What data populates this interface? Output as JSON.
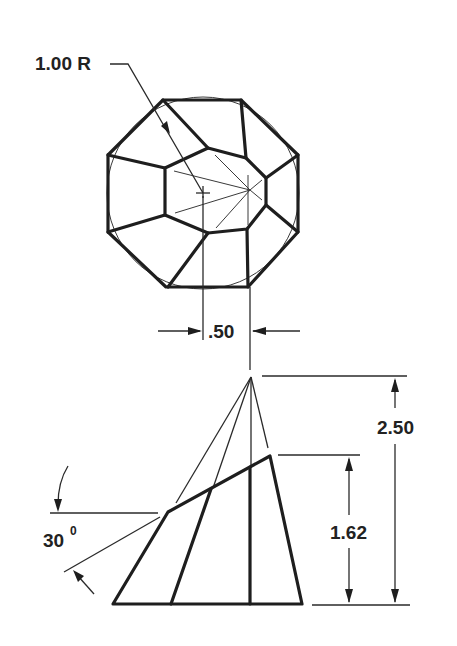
{
  "drawing": {
    "type": "engineering orthographic drawing",
    "subject": "truncated pyramid (frustum) with octagonal base — top view and front view",
    "top_view": {
      "radius_label": "1.00 R",
      "offset_dimension": ".50"
    },
    "front_view": {
      "overall_height": "2.50",
      "frustum_height": "1.62",
      "angle_value": "30",
      "angle_unit": "0"
    }
  },
  "colors": {
    "line": "#1e1e1e",
    "background": "#ffffff"
  }
}
